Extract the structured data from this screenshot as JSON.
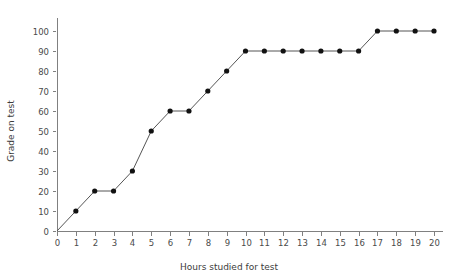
{
  "chart_data": {
    "type": "line",
    "title": "",
    "xlabel": "Hours studied for test",
    "ylabel": "Grade on test",
    "xlim": [
      0,
      20
    ],
    "ylim": [
      0,
      100
    ],
    "x": [
      0,
      1,
      2,
      3,
      4,
      5,
      6,
      7,
      8,
      9,
      10,
      11,
      12,
      13,
      14,
      15,
      16,
      17,
      18,
      19,
      20
    ],
    "values": [
      0,
      10,
      20,
      20,
      30,
      50,
      60,
      60,
      70,
      80,
      90,
      90,
      90,
      90,
      90,
      90,
      90,
      100,
      100,
      100,
      100
    ],
    "xticks": [
      "0",
      "1",
      "2",
      "3",
      "4",
      "5",
      "6",
      "7",
      "8",
      "9",
      "10",
      "11",
      "12",
      "13",
      "14",
      "15",
      "16",
      "17",
      "18",
      "19",
      "20"
    ],
    "yticks": [
      "0",
      "10",
      "20",
      "30",
      "40",
      "50",
      "60",
      "70",
      "80",
      "90",
      "100"
    ],
    "grid": false,
    "legend": false,
    "marker": "filled-circle",
    "line_color": "#555555",
    "marker_color": "#111111",
    "axis_color": "#808080",
    "background": "#ffffff",
    "markers_shown_from_index": 1
  }
}
